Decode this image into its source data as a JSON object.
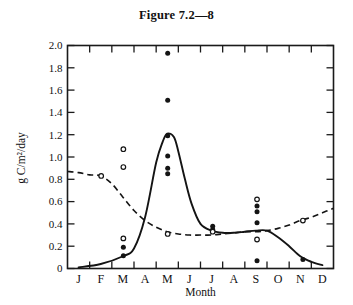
{
  "figure": {
    "title": "Figure 7.2—8"
  },
  "chart_data": {
    "type": "line",
    "title": "Figure 7.2—8",
    "xlabel": "Month",
    "ylabel": "g C/m²/day",
    "xlim": [
      0,
      12
    ],
    "ylim": [
      0,
      2.0
    ],
    "grid": false,
    "legend": "none",
    "x_categories": [
      "J",
      "F",
      "M",
      "A",
      "M",
      "J",
      "J",
      "A",
      "S",
      "O",
      "N",
      "D"
    ],
    "y_ticks": [
      "0",
      "0.2",
      "0.4",
      "0.6",
      "0.8",
      "1.0",
      "1.2",
      "1.4",
      "1.6",
      "1.8",
      "2.0"
    ],
    "y_tick_values": [
      0,
      0.2,
      0.4,
      0.6,
      0.8,
      1.0,
      1.2,
      1.4,
      1.6,
      1.8,
      2.0
    ],
    "y_tick_interval": 0.2,
    "series": [
      {
        "name": "solid-curve",
        "style": "solid",
        "marker": "filled-circle",
        "x": [
          0.5,
          1.5,
          2.5,
          3.0,
          3.5,
          4.0,
          4.3,
          4.5,
          4.8,
          5.0,
          5.3,
          5.6,
          6.0,
          6.5,
          7.0,
          7.5,
          8.0,
          8.5,
          9.0,
          9.5,
          10.0,
          10.5,
          11.0,
          11.5
        ],
        "y": [
          0.01,
          0.04,
          0.11,
          0.18,
          0.46,
          0.95,
          1.14,
          1.21,
          1.18,
          1.05,
          0.8,
          0.58,
          0.4,
          0.34,
          0.32,
          0.32,
          0.33,
          0.34,
          0.34,
          0.28,
          0.2,
          0.11,
          0.06,
          0.03
        ]
      },
      {
        "name": "dashed-curve",
        "style": "dashed",
        "marker": "open-circle",
        "x": [
          0.0,
          0.5,
          1.0,
          1.5,
          2.0,
          2.5,
          3.0,
          3.5,
          4.0,
          4.5,
          5.0,
          5.5,
          6.0,
          6.5,
          7.0,
          7.5,
          8.0,
          8.5,
          9.0,
          9.5,
          10.0,
          10.5,
          11.0,
          11.5,
          12.0
        ],
        "y": [
          0.87,
          0.86,
          0.84,
          0.83,
          0.76,
          0.64,
          0.52,
          0.43,
          0.37,
          0.33,
          0.31,
          0.3,
          0.3,
          0.3,
          0.31,
          0.32,
          0.33,
          0.33,
          0.34,
          0.36,
          0.39,
          0.43,
          0.46,
          0.5,
          0.54
        ]
      }
    ],
    "scatter_filled": [
      {
        "month": "M",
        "x": 2.52,
        "y": 0.19
      },
      {
        "month": "M",
        "x": 2.52,
        "y": 0.115
      },
      {
        "month": "M",
        "x": 4.52,
        "y": 1.93
      },
      {
        "month": "M",
        "x": 4.52,
        "y": 1.51
      },
      {
        "month": "M",
        "x": 4.52,
        "y": 1.19
      },
      {
        "month": "M",
        "x": 4.52,
        "y": 1.01
      },
      {
        "month": "M",
        "x": 4.52,
        "y": 0.9
      },
      {
        "month": "M",
        "x": 4.52,
        "y": 0.85
      },
      {
        "month": "J",
        "x": 6.55,
        "y": 0.38
      },
      {
        "month": "J",
        "x": 6.55,
        "y": 0.35
      },
      {
        "month": "S",
        "x": 8.55,
        "y": 0.56
      },
      {
        "month": "S",
        "x": 8.55,
        "y": 0.51
      },
      {
        "month": "S",
        "x": 8.55,
        "y": 0.41
      },
      {
        "month": "S",
        "x": 8.55,
        "y": 0.07
      },
      {
        "month": "N",
        "x": 10.62,
        "y": 0.08
      }
    ],
    "scatter_open": [
      {
        "month": "F",
        "x": 1.52,
        "y": 0.83
      },
      {
        "month": "M",
        "x": 2.52,
        "y": 1.07
      },
      {
        "month": "M",
        "x": 2.52,
        "y": 0.91
      },
      {
        "month": "M",
        "x": 2.52,
        "y": 0.27
      },
      {
        "month": "M",
        "x": 4.52,
        "y": 0.31
      },
      {
        "month": "J",
        "x": 6.55,
        "y": 0.33
      },
      {
        "month": "S",
        "x": 8.55,
        "y": 0.62
      },
      {
        "month": "S",
        "x": 8.55,
        "y": 0.26
      },
      {
        "month": "N",
        "x": 10.62,
        "y": 0.43
      }
    ]
  }
}
